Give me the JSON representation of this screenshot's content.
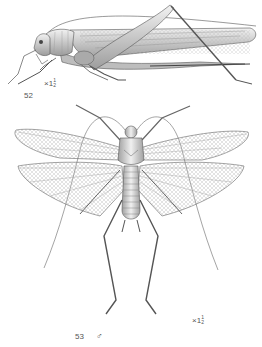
{
  "figures": [
    {
      "number": "52",
      "view": "lateral",
      "magnification": {
        "prefix": "×",
        "whole": "1",
        "numerator": "1",
        "denominator": "2"
      }
    },
    {
      "number": "53",
      "sex_symbol": "♂",
      "view": "dorsal, wings spread",
      "magnification": {
        "prefix": "×",
        "whole": "1",
        "numerator": "1",
        "denominator": "2"
      }
    }
  ],
  "colors": {
    "background": "#ffffff",
    "ink": "#444444",
    "shade": "#9a9a9a",
    "light": "#d8d8d8"
  }
}
